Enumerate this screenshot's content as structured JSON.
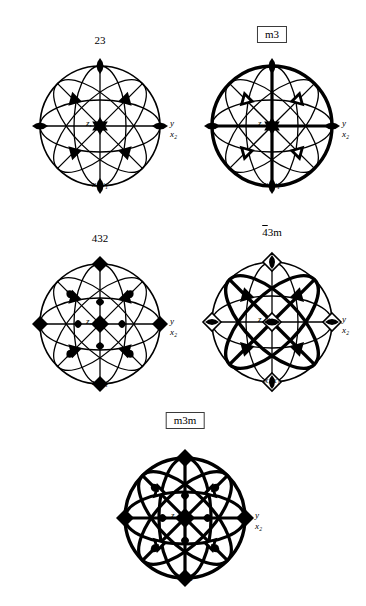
{
  "figure": {
    "background_color": "#ffffff",
    "ink_color": "#000000",
    "box_border_color": "#3a3a3a"
  },
  "axis_labels": {
    "center": "z, x₃",
    "right_top": "y",
    "right_bottom": "x₂",
    "bottom": "x, x₁"
  },
  "diagrams": [
    {
      "id": "pg-23",
      "title": "23",
      "title_boxed": false,
      "title_overline": false,
      "outer_circle": "thin",
      "axes": "thin",
      "cardinal_symbol": "lens-filled",
      "center_symbol": "triad-filled",
      "diagonal_symbol": "triad-filled",
      "edge_midpoint_symbol": "none",
      "mirror_lines": "none"
    },
    {
      "id": "pg-m3",
      "title": "m3",
      "title_boxed": true,
      "title_overline": false,
      "outer_circle": "thick",
      "axes": "thick",
      "cardinal_symbol": "lens-filled",
      "center_symbol": "triad-filled",
      "diagonal_symbol": "triad-open",
      "edge_midpoint_symbol": "none",
      "mirror_lines": "axial"
    },
    {
      "id": "pg-432",
      "title": "432",
      "title_boxed": false,
      "title_overline": false,
      "outer_circle": "thin",
      "axes": "thin",
      "cardinal_symbol": "square-filled",
      "center_symbol": "square-filled",
      "diagonal_symbol": "triad-filled",
      "edge_midpoint_symbol": "lens-filled",
      "mirror_lines": "none"
    },
    {
      "id": "pg-43m",
      "title": "43m",
      "title_boxed": false,
      "title_overline": true,
      "outer_circle": "thin",
      "axes": "thin",
      "cardinal_symbol": "square-open-lens",
      "center_symbol": "lens-filled",
      "diagonal_symbol": "triad-filled",
      "edge_midpoint_symbol": "none",
      "mirror_lines": "diagonal-thick"
    },
    {
      "id": "pg-m3m",
      "title": "m3m",
      "title_boxed": true,
      "title_overline": false,
      "outer_circle": "thick",
      "axes": "thick",
      "cardinal_symbol": "square-filled",
      "center_symbol": "square-filled",
      "diagonal_symbol": "triad-open",
      "edge_midpoint_symbol": "lens-filled",
      "mirror_lines": "all-thick"
    }
  ]
}
